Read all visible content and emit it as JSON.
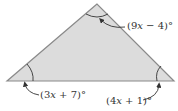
{
  "diagram": {
    "type": "triangle",
    "fill_color": "#dcdcdc",
    "stroke_color": "#8a8a8a",
    "vertices": {
      "apex": [
        97,
        4
      ],
      "left": [
        7,
        81
      ],
      "right": [
        174,
        81
      ]
    },
    "angles": [
      {
        "vertex": "apex",
        "label_prefix": "(9",
        "var": "x",
        "label_suffix": " − 4)°",
        "full": "(9x − 4)°"
      },
      {
        "vertex": "left",
        "label_prefix": "(3",
        "var": "x",
        "label_suffix": " + 7)°",
        "full": "(3x + 7)°"
      },
      {
        "vertex": "right",
        "label_prefix": "(4",
        "var": "x",
        "label_suffix": " + 1)°",
        "full": "(4x + 1)°"
      }
    ]
  }
}
